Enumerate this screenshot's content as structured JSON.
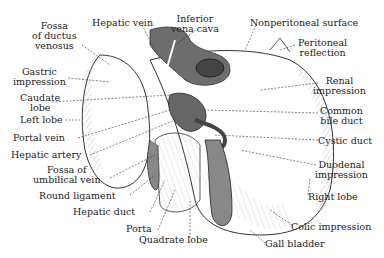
{
  "diagram": {
    "labels_left": [
      {
        "id": "fossa-ductus-venosus",
        "text": [
          "Fossa",
          "of ductus",
          "venosus"
        ]
      },
      {
        "id": "gastric-impression",
        "text": [
          "Gastric",
          "impression"
        ]
      },
      {
        "id": "caudate-lobe",
        "text": [
          "Caudate",
          "lobe"
        ]
      },
      {
        "id": "left-lobe",
        "text": [
          "Left lobe"
        ]
      },
      {
        "id": "portal-vein",
        "text": [
          "Portal vein"
        ]
      },
      {
        "id": "hepatic-artery",
        "text": [
          "Hepatic artery"
        ]
      },
      {
        "id": "fossa-umbilical-vein",
        "text": [
          "Fossa of",
          "umbilical vein"
        ]
      },
      {
        "id": "round-ligament",
        "text": [
          "Round ligament"
        ]
      },
      {
        "id": "hepatic-duct",
        "text": [
          "Hepatic duct"
        ]
      },
      {
        "id": "porta",
        "text": [
          "Porta"
        ]
      },
      {
        "id": "quadrate-lobe",
        "text": [
          "Quadrate lobe"
        ]
      }
    ],
    "labels_top": [
      {
        "id": "hepatic-vein",
        "text": [
          "Hepatic vein"
        ]
      },
      {
        "id": "inferior-vena-cava",
        "text": [
          "Inferior",
          "vena cava"
        ]
      },
      {
        "id": "nonperitoneal-surface",
        "text": [
          "Nonperitoneal surface"
        ]
      }
    ],
    "labels_right": [
      {
        "id": "peritoneal-reflection",
        "text": [
          "Peritoneal",
          "reflection"
        ]
      },
      {
        "id": "renal-impression",
        "text": [
          "Renal",
          "impression"
        ]
      },
      {
        "id": "common-bile-duct",
        "text": [
          "Common",
          "bile duct"
        ]
      },
      {
        "id": "cystic-duct",
        "text": [
          "Cystic duct"
        ]
      },
      {
        "id": "duodenal-impression",
        "text": [
          "Duodenal",
          "impression"
        ]
      },
      {
        "id": "right-lobe",
        "text": [
          "Right lobe"
        ]
      },
      {
        "id": "colic-impression",
        "text": [
          "Colic impression"
        ]
      },
      {
        "id": "gall-bladder",
        "text": [
          "Gall bladder"
        ]
      }
    ],
    "colors": {
      "ink": "#222222",
      "shade": "#8a8a8a",
      "dark": "#555555",
      "paper": "#ffffff"
    }
  }
}
